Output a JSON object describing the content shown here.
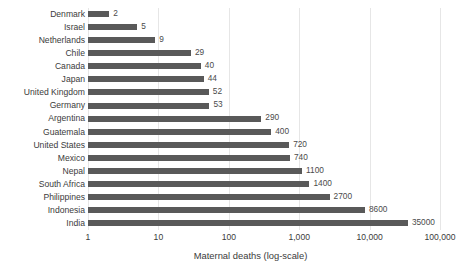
{
  "chart_data": {
    "type": "bar",
    "orientation": "horizontal",
    "title": "",
    "xlabel": "Maternal deaths (log-scale)",
    "ylabel": "",
    "scale": "log",
    "grid": true,
    "legend": "none",
    "xlim": [
      1,
      100000
    ],
    "xticks": [
      1,
      10,
      100,
      1000,
      10000,
      100000
    ],
    "xtick_labels": [
      "1",
      "10",
      "100",
      "1,000",
      "10,000",
      "100,000"
    ],
    "categories": [
      "Denmark",
      "Israel",
      "Netherlands",
      "Chile",
      "Canada",
      "Japan",
      "United Kingdom",
      "Germany",
      "Argentina",
      "Guatemala",
      "United States",
      "Mexico",
      "Nepal",
      "South Africa",
      "Philippines",
      "Indonesia",
      "India"
    ],
    "values": [
      2,
      5,
      9,
      29,
      40,
      44,
      52,
      53,
      290,
      400,
      720,
      740,
      1100,
      1400,
      2700,
      8600,
      35000
    ],
    "value_labels": [
      "2",
      "5",
      "9",
      "29",
      "40",
      "44",
      "52",
      "53",
      "290",
      "400",
      "720",
      "740",
      "1100",
      "1400",
      "2700",
      "8600",
      "35000"
    ],
    "bar_color": "#595959",
    "gridline_color": "#e6e6e6",
    "text_color": "#3b3b3b",
    "background_color": "#ffffff"
  }
}
